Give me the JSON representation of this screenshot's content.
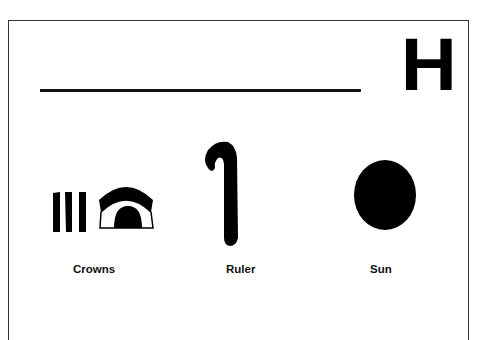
{
  "worksheet": {
    "letter": "H",
    "writing_line": "blank handwriting line",
    "glyphs": [
      {
        "label": "Crowns",
        "icon": "crowns-hieroglyph-icon"
      },
      {
        "label": "Ruler",
        "icon": "ruler-crook-hieroglyph-icon"
      },
      {
        "label": "Sun",
        "icon": "sun-disc-hieroglyph-icon"
      }
    ]
  }
}
